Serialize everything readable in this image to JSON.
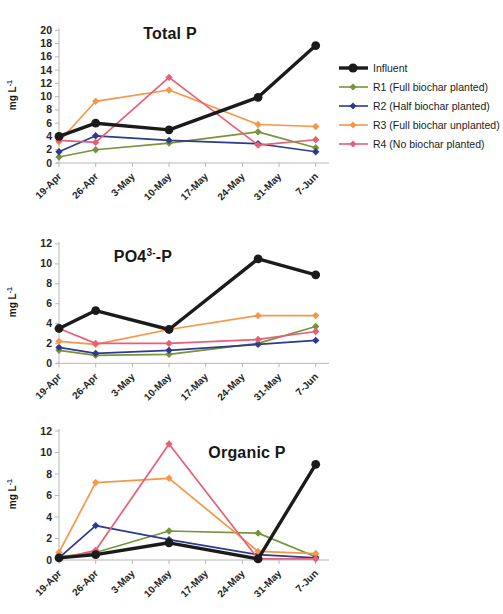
{
  "figure": {
    "background": "#ffffff"
  },
  "ylabel_parts": {
    "main": "mg L",
    "sup": "-1"
  },
  "x_tick_labels": [
    "19-Apr",
    "26-Apr",
    "3-May",
    "10-May",
    "17-May",
    "24-May",
    "31-May",
    "7-Jun"
  ],
  "colors": {
    "influent": "#1b1b1b",
    "r1": "#77933c",
    "r2": "#2d3a8d",
    "r3": "#f79646",
    "r4": "#e85d78",
    "axis": "#b7b7b7",
    "tick_text": "#262626"
  },
  "legend": {
    "items": [
      {
        "key": "influent",
        "label": "Influent"
      },
      {
        "key": "r1",
        "label": "R1 (Full biochar planted)"
      },
      {
        "key": "r2",
        "label": "R2 (Half biochar planted)"
      },
      {
        "key": "r3",
        "label": "R3 (Full biochar unplanted)"
      },
      {
        "key": "r4",
        "label": "R4 (No biochar planted)"
      }
    ]
  },
  "chart_data": [
    {
      "type": "line",
      "title": "Total P",
      "ylabel": "mg L-1",
      "ylim": [
        0,
        20
      ],
      "y_ticks": [
        0,
        2,
        4,
        6,
        8,
        10,
        12,
        14,
        16,
        18,
        20
      ],
      "x_tick_labels": [
        "19-Apr",
        "26-Apr",
        "3-May",
        "10-May",
        "17-May",
        "24-May",
        "31-May",
        "7-Jun"
      ],
      "x_tick_days": [
        0,
        7,
        14,
        21,
        28,
        35,
        42,
        49
      ],
      "sample_days": [
        0,
        7,
        21,
        38,
        49
      ],
      "legend_position": "right",
      "grid": false,
      "series": [
        {
          "name": "Influent",
          "key": "influent",
          "values": [
            4.0,
            6.0,
            5.0,
            9.9,
            17.7
          ]
        },
        {
          "name": "R1 (Full biochar planted)",
          "key": "r1",
          "values": [
            0.9,
            2.0,
            3.0,
            4.7,
            2.3
          ]
        },
        {
          "name": "R2 (Half biochar planted)",
          "key": "r2",
          "values": [
            1.7,
            4.1,
            3.4,
            2.9,
            1.7
          ]
        },
        {
          "name": "R3 (Full biochar unplanted)",
          "key": "r3",
          "values": [
            3.2,
            9.3,
            11.0,
            5.8,
            5.5
          ]
        },
        {
          "name": "R4 (No biochar planted)",
          "key": "r4",
          "values": [
            3.4,
            3.1,
            12.9,
            2.7,
            3.5
          ]
        }
      ]
    },
    {
      "type": "line",
      "title": "PO4³⁻-P",
      "title_parts": {
        "pre": "PO4",
        "sup": "3-",
        "post": "-P"
      },
      "ylabel": "mg L-1",
      "ylim": [
        0,
        12
      ],
      "y_ticks": [
        0,
        2,
        4,
        6,
        8,
        10,
        12
      ],
      "x_tick_labels": [
        "19-Apr",
        "26-Apr",
        "3-May",
        "10-May",
        "17-May",
        "24-May",
        "31-May",
        "7-Jun"
      ],
      "x_tick_days": [
        0,
        7,
        14,
        21,
        28,
        35,
        42,
        49
      ],
      "sample_days": [
        0,
        7,
        21,
        38,
        49
      ],
      "grid": false,
      "series": [
        {
          "name": "Influent",
          "key": "influent",
          "values": [
            3.5,
            5.3,
            3.4,
            10.5,
            8.9
          ]
        },
        {
          "name": "R1 (Full biochar planted)",
          "key": "r1",
          "values": [
            1.3,
            0.8,
            0.9,
            2.0,
            3.7
          ]
        },
        {
          "name": "R2 (Half biochar planted)",
          "key": "r2",
          "values": [
            1.6,
            1.0,
            1.3,
            1.9,
            2.3
          ]
        },
        {
          "name": "R3 (Full biochar unplanted)",
          "key": "r3",
          "values": [
            2.2,
            1.9,
            3.4,
            4.8,
            4.8
          ]
        },
        {
          "name": "R4 (No biochar planted)",
          "key": "r4",
          "values": [
            3.5,
            2.0,
            2.0,
            2.4,
            3.2
          ]
        }
      ]
    },
    {
      "type": "line",
      "title": "Organic P",
      "ylabel": "mg L-1",
      "ylim": [
        0,
        12
      ],
      "y_ticks": [
        0,
        2,
        4,
        6,
        8,
        10,
        12
      ],
      "x_tick_labels": [
        "19-Apr",
        "26-Apr",
        "3-May",
        "10-May",
        "17-May",
        "24-May",
        "31-May",
        "7-Jun"
      ],
      "x_tick_days": [
        0,
        7,
        14,
        21,
        28,
        35,
        42,
        49
      ],
      "sample_days": [
        0,
        7,
        21,
        38,
        49
      ],
      "grid": false,
      "series": [
        {
          "name": "Influent",
          "key": "influent",
          "values": [
            0.2,
            0.5,
            1.6,
            0.1,
            8.9
          ]
        },
        {
          "name": "R1 (Full biochar planted)",
          "key": "r1",
          "values": [
            0.3,
            0.7,
            2.7,
            2.5,
            0.3
          ]
        },
        {
          "name": "R2 (Half biochar planted)",
          "key": "r2",
          "values": [
            0.2,
            3.2,
            1.9,
            0.5,
            0.2
          ]
        },
        {
          "name": "R3 (Full biochar unplanted)",
          "key": "r3",
          "values": [
            0.7,
            7.2,
            7.6,
            0.8,
            0.6
          ]
        },
        {
          "name": "R4 (No biochar planted)",
          "key": "r4",
          "values": [
            0.1,
            0.9,
            10.8,
            0.1,
            0.1
          ]
        }
      ]
    }
  ]
}
